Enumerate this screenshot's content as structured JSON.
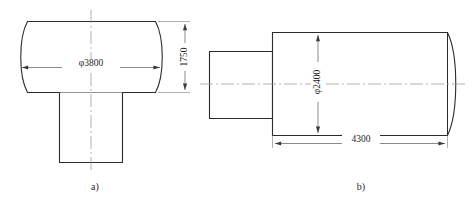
{
  "figure": {
    "type": "engineering-drawing",
    "views": [
      {
        "id": "view-a",
        "caption": "a)",
        "orientation": "plan",
        "dimensions": [
          {
            "id": "diameter-3800",
            "label": "φ3800",
            "value": 3800,
            "unit": "mm",
            "kind": "diameter",
            "placement": "horizontal"
          },
          {
            "id": "height-1750",
            "label": "1750",
            "value": 1750,
            "unit": "mm",
            "kind": "linear",
            "placement": "vertical"
          }
        ]
      },
      {
        "id": "view-b",
        "caption": "b)",
        "orientation": "elevation",
        "dimensions": [
          {
            "id": "diameter-2400",
            "label": "φ2400",
            "value": 2400,
            "unit": "mm",
            "kind": "diameter",
            "placement": "vertical"
          },
          {
            "id": "length-4300",
            "label": "4300",
            "value": 4300,
            "unit": "mm",
            "kind": "linear",
            "placement": "horizontal"
          }
        ]
      }
    ]
  },
  "labels": {
    "dia_3800": "φ3800",
    "dim_1750": "1750",
    "dia_2400": "φ2400",
    "dim_4300": "4300",
    "caption_a": "a)",
    "caption_b": "b)"
  },
  "colors": {
    "outline": "#2b2b2b",
    "centerline": "#9a9a9a",
    "dimension": "#4a4a4a",
    "extension": "#7d7d7d",
    "text": "#1f1f1f",
    "background": "#ffffff"
  }
}
